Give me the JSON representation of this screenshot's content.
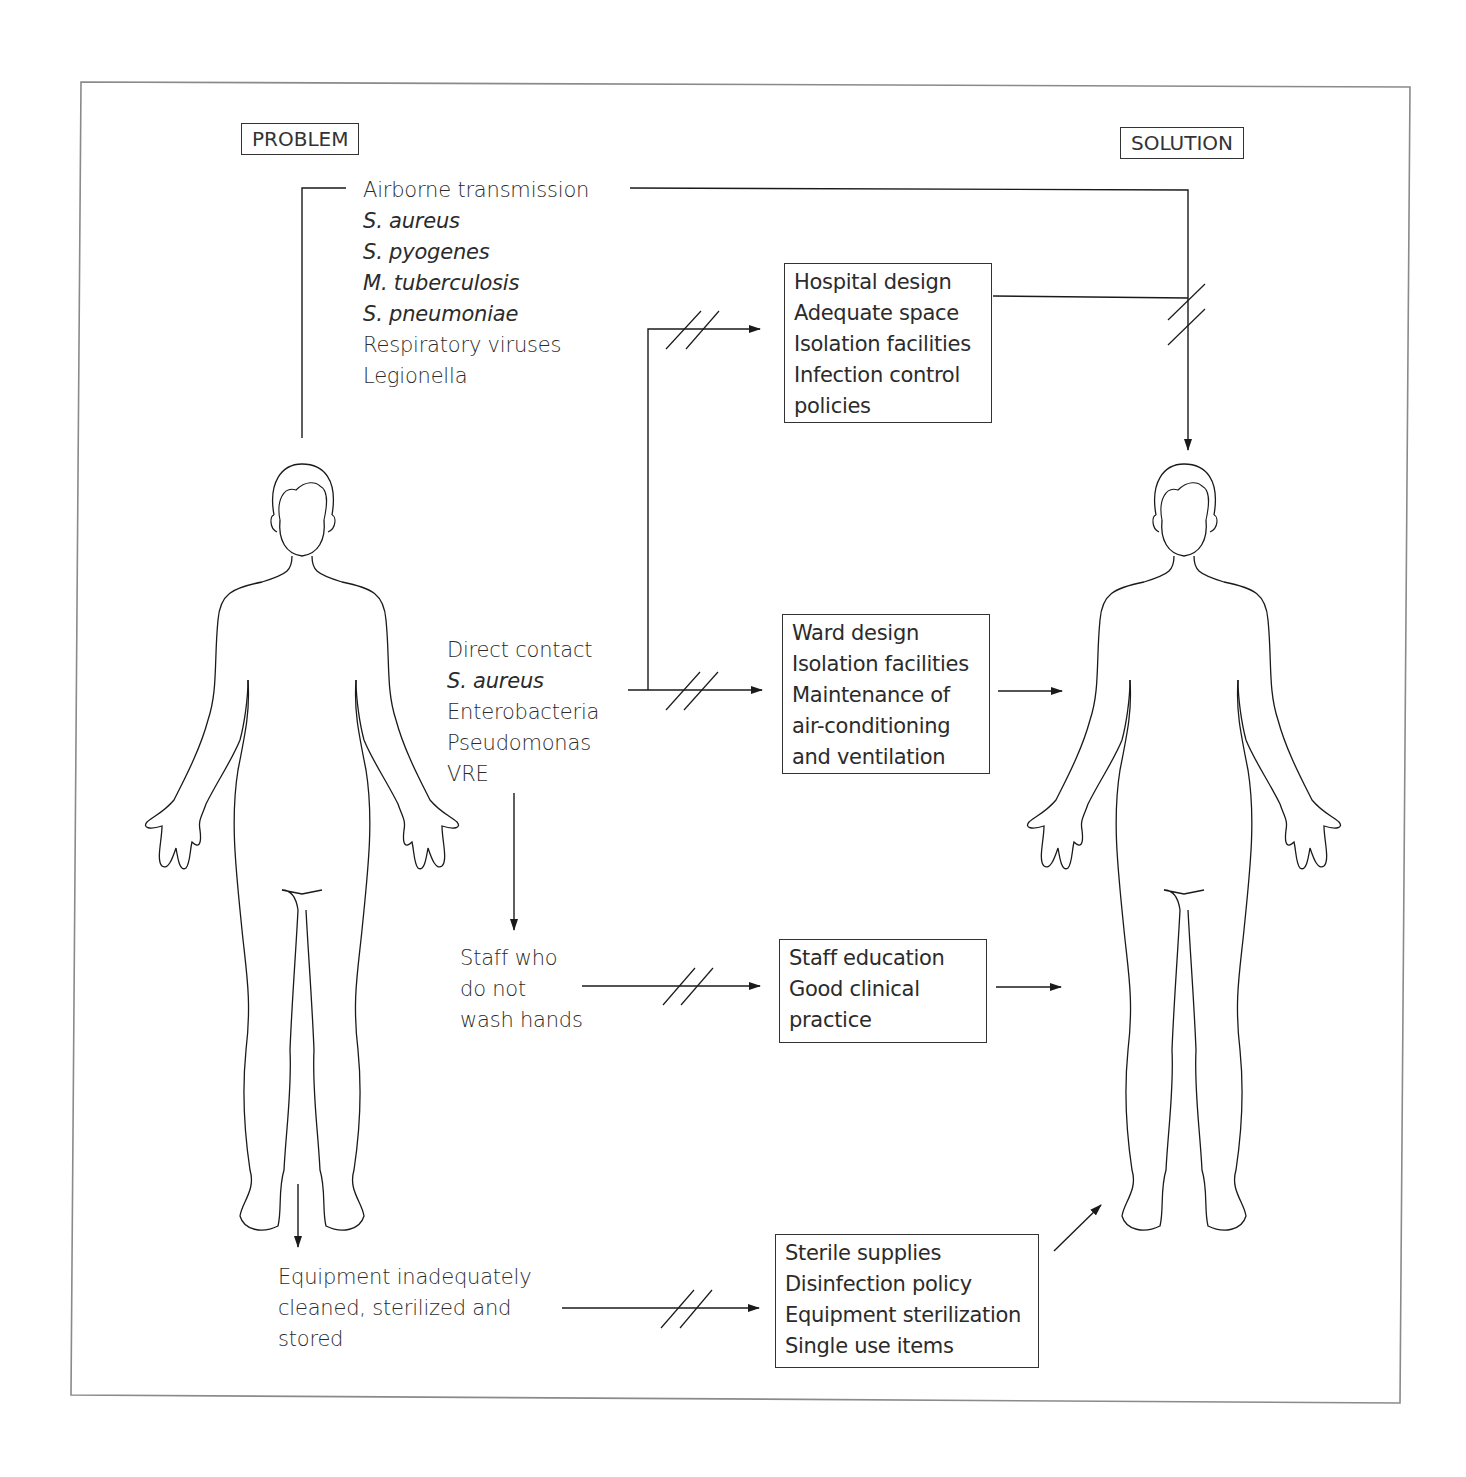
{
  "headers": {
    "problem": "PROBLEM",
    "solution": "SOLUTION"
  },
  "problems": {
    "airborne": {
      "title": "Airborne transmission",
      "organisms": [
        "S. aureus",
        "S. pyogenes",
        "M. tuberculosis",
        "S. pneumoniae"
      ],
      "others": [
        "Respiratory viruses",
        "Legionella"
      ]
    },
    "direct_contact": {
      "title": "Direct contact",
      "organisms": [
        "S. aureus"
      ],
      "others": [
        "Enterobacteria",
        "Pseudomonas",
        "VRE"
      ]
    },
    "staff": {
      "lines": [
        "Staff who",
        "do not",
        "wash hands"
      ]
    },
    "equipment": {
      "lines": [
        "Equipment inadequately",
        "cleaned, sterilized and",
        "stored"
      ]
    }
  },
  "solutions": {
    "hospital": {
      "lines": [
        "Hospital design",
        "Adequate space",
        "Isolation facilities",
        "Infection control",
        "policies"
      ]
    },
    "ward": {
      "lines": [
        "Ward design",
        "Isolation facilities",
        "Maintenance of",
        "air-conditioning",
        "and ventilation"
      ]
    },
    "staff": {
      "lines": [
        "Staff education",
        "Good clinical",
        "practice"
      ]
    },
    "equipment": {
      "lines": [
        "Sterile supplies",
        "Disinfection policy",
        "Equipment sterilization",
        "Single use items"
      ]
    }
  },
  "figures": {
    "left": "human-figure-problem",
    "right": "human-figure-solution"
  },
  "colors": {
    "line": "#1a1a1a",
    "frame": "#8a8a8a",
    "text": "#2b2b2b"
  }
}
